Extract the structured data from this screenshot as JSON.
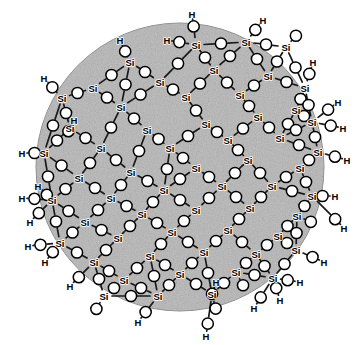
{
  "figure": {
    "background_color": "#ffffff",
    "particle_fill_color": "#b6b6b6",
    "particle_edge_color": "#8e8e8e",
    "bond_color": "#1a1a1a",
    "atom_fill_color": "#ffffff",
    "atom_stroke_color": "#000000",
    "label_color": "#000000"
  },
  "particle": {
    "shape": "circle",
    "cx": 180,
    "cy": 167,
    "r": 144
  },
  "legend": {
    "silicon_symbol": "Si",
    "hydrogen_symbol": "H",
    "oxygen_symbol": "O"
  },
  "chart_data": {
    "type": "diagram",
    "silicon_atoms": [
      {
        "x": 196,
        "y": 45
      },
      {
        "x": 246,
        "y": 42
      },
      {
        "x": 286,
        "y": 47
      },
      {
        "x": 130,
        "y": 62
      },
      {
        "x": 93,
        "y": 88
      },
      {
        "x": 160,
        "y": 82
      },
      {
        "x": 214,
        "y": 70
      },
      {
        "x": 268,
        "y": 76
      },
      {
        "x": 305,
        "y": 88
      },
      {
        "x": 62,
        "y": 98
      },
      {
        "x": 121,
        "y": 107
      },
      {
        "x": 186,
        "y": 97
      },
      {
        "x": 240,
        "y": 95
      },
      {
        "x": 296,
        "y": 110
      },
      {
        "x": 70,
        "y": 128
      },
      {
        "x": 147,
        "y": 130
      },
      {
        "x": 206,
        "y": 124
      },
      {
        "x": 258,
        "y": 117
      },
      {
        "x": 312,
        "y": 122
      },
      {
        "x": 44,
        "y": 153
      },
      {
        "x": 101,
        "y": 148
      },
      {
        "x": 170,
        "y": 148
      },
      {
        "x": 228,
        "y": 140
      },
      {
        "x": 280,
        "y": 138
      },
      {
        "x": 318,
        "y": 152
      },
      {
        "x": 79,
        "y": 178
      },
      {
        "x": 131,
        "y": 172
      },
      {
        "x": 196,
        "y": 168
      },
      {
        "x": 248,
        "y": 160
      },
      {
        "x": 300,
        "y": 168
      },
      {
        "x": 52,
        "y": 200
      },
      {
        "x": 111,
        "y": 198
      },
      {
        "x": 164,
        "y": 190
      },
      {
        "x": 222,
        "y": 186
      },
      {
        "x": 272,
        "y": 186
      },
      {
        "x": 312,
        "y": 196
      },
      {
        "x": 85,
        "y": 222
      },
      {
        "x": 142,
        "y": 214
      },
      {
        "x": 196,
        "y": 210
      },
      {
        "x": 250,
        "y": 208
      },
      {
        "x": 297,
        "y": 216
      },
      {
        "x": 60,
        "y": 243
      },
      {
        "x": 118,
        "y": 238
      },
      {
        "x": 172,
        "y": 232
      },
      {
        "x": 228,
        "y": 230
      },
      {
        "x": 278,
        "y": 236
      },
      {
        "x": 94,
        "y": 262
      },
      {
        "x": 150,
        "y": 256
      },
      {
        "x": 204,
        "y": 252
      },
      {
        "x": 256,
        "y": 254
      },
      {
        "x": 296,
        "y": 250
      },
      {
        "x": 124,
        "y": 280
      },
      {
        "x": 180,
        "y": 274
      },
      {
        "x": 236,
        "y": 272
      },
      {
        "x": 273,
        "y": 278
      },
      {
        "x": 158,
        "y": 296
      },
      {
        "x": 212,
        "y": 294
      },
      {
        "x": 104,
        "y": 296
      }
    ],
    "surface_hydroxyl_count": 26,
    "hydrogen_labels": [
      {
        "x": 192,
        "y": 14,
        "text": "H"
      },
      {
        "x": 263,
        "y": 20,
        "text": "H"
      },
      {
        "x": 167,
        "y": 40,
        "text": "H"
      },
      {
        "x": 120,
        "y": 40,
        "text": "H"
      },
      {
        "x": 44,
        "y": 78,
        "text": "H"
      },
      {
        "x": 313,
        "y": 62,
        "text": "H"
      },
      {
        "x": 74,
        "y": 120,
        "text": "H"
      },
      {
        "x": 338,
        "y": 102,
        "text": "H"
      },
      {
        "x": 343,
        "y": 128,
        "text": "H"
      },
      {
        "x": 22,
        "y": 153,
        "text": "H"
      },
      {
        "x": 38,
        "y": 186,
        "text": "H"
      },
      {
        "x": 347,
        "y": 160,
        "text": "H"
      },
      {
        "x": 22,
        "y": 198,
        "text": "H"
      },
      {
        "x": 335,
        "y": 196,
        "text": "H"
      },
      {
        "x": 30,
        "y": 222,
        "text": "H"
      },
      {
        "x": 28,
        "y": 246,
        "text": "H"
      },
      {
        "x": 45,
        "y": 262,
        "text": "H"
      },
      {
        "x": 344,
        "y": 228,
        "text": "H"
      },
      {
        "x": 324,
        "y": 262,
        "text": "H"
      },
      {
        "x": 70,
        "y": 286,
        "text": "H"
      },
      {
        "x": 300,
        "y": 282,
        "text": "H"
      },
      {
        "x": 216,
        "y": 282,
        "text": "H"
      },
      {
        "x": 138,
        "y": 322,
        "text": "H"
      },
      {
        "x": 206,
        "y": 336,
        "text": "H"
      },
      {
        "x": 254,
        "y": 308,
        "text": "H"
      },
      {
        "x": 280,
        "y": 300,
        "text": "H"
      }
    ]
  }
}
